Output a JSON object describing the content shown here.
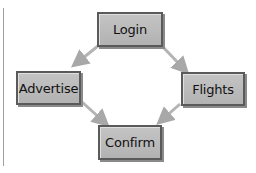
{
  "diagram": {
    "nodes": [
      {
        "id": "login",
        "label": "Login"
      },
      {
        "id": "advertise",
        "label": "Advertise"
      },
      {
        "id": "flights",
        "label": "Flights"
      },
      {
        "id": "confirm",
        "label": "Confirm"
      }
    ],
    "edges": [
      {
        "from": "login",
        "to": "advertise"
      },
      {
        "from": "login",
        "to": "flights"
      },
      {
        "from": "advertise",
        "to": "confirm"
      },
      {
        "from": "flights",
        "to": "confirm"
      }
    ],
    "colors": {
      "box_fill": "#bcbcbc",
      "box_border": "#5a5a5a",
      "arrow": "#b0b0b0"
    }
  }
}
